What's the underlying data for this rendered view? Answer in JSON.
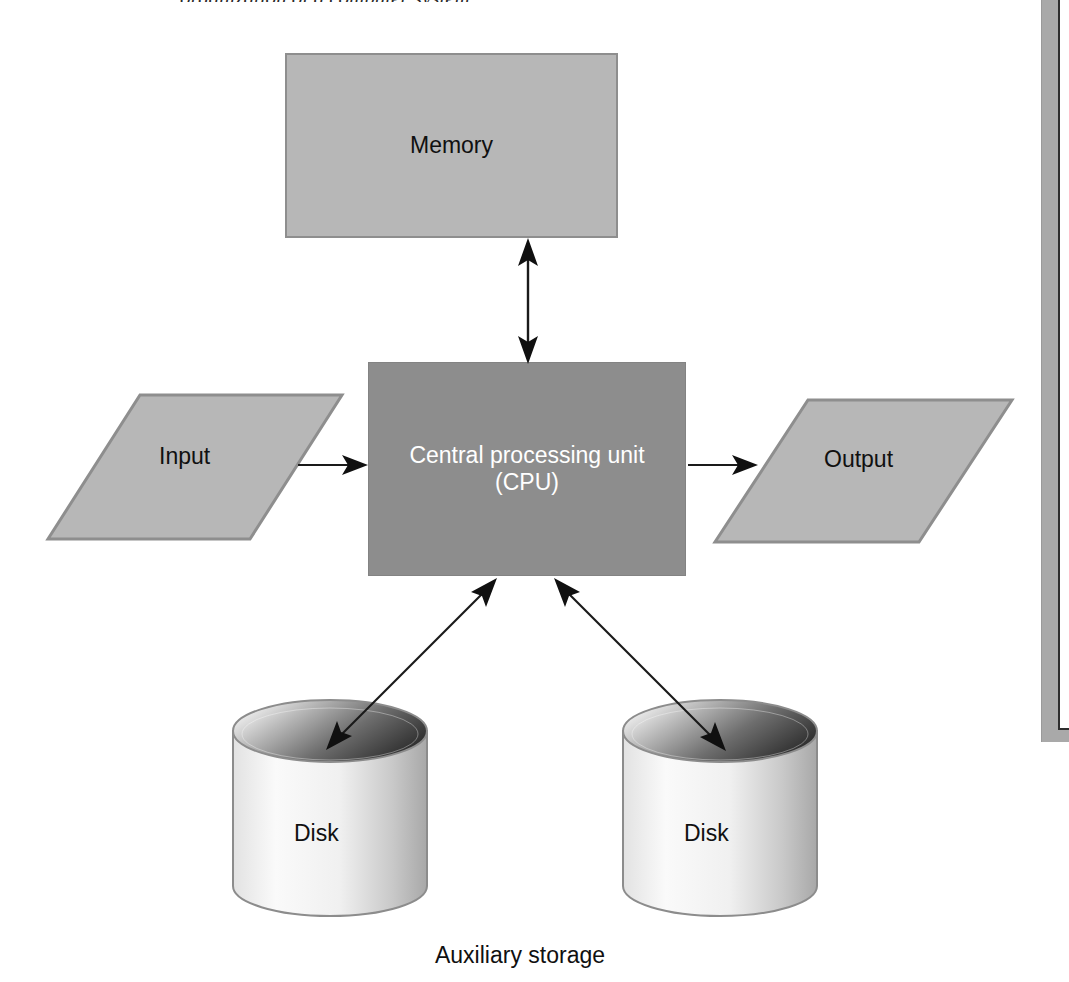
{
  "figure": {
    "title_partial": "organization of a computer system",
    "nodes": {
      "memory": {
        "label": "Memory",
        "fill": "#b7b7b7",
        "border": "#8e8e8e",
        "text_color": "#101010",
        "shape": "rectangle"
      },
      "cpu": {
        "label_line1": "Central processing unit",
        "label_line2": "(CPU)",
        "fill": "#8d8d8d",
        "border": "#838383",
        "text_color": "#ffffff",
        "shape": "rectangle"
      },
      "input": {
        "label": "Input",
        "fill": "#b7b7b7",
        "border": "#8e8e8e",
        "text_color": "#101010",
        "shape": "parallelogram"
      },
      "output": {
        "label": "Output",
        "fill": "#b7b7b7",
        "border": "#8e8e8e",
        "text_color": "#101010",
        "shape": "parallelogram"
      },
      "disk_left": {
        "label": "Disk",
        "fill_light": "#f2f2f2",
        "fill_dark": "#9d9d9d",
        "top_dark": "#3a3a3a",
        "text_color": "#101010",
        "shape": "cylinder"
      },
      "disk_right": {
        "label": "Disk",
        "fill_light": "#f2f2f2",
        "fill_dark": "#9d9d9d",
        "top_dark": "#3a3a3a",
        "text_color": "#101010",
        "shape": "cylinder"
      }
    },
    "captions": {
      "auxiliary_storage": "Auxiliary storage"
    },
    "edges": [
      {
        "name": "memory-cpu",
        "from": "memory",
        "to": "cpu",
        "arrow": "double",
        "orientation": "vertical"
      },
      {
        "name": "input-cpu",
        "from": "input",
        "to": "cpu",
        "arrow": "single",
        "orientation": "horizontal"
      },
      {
        "name": "cpu-output",
        "from": "cpu",
        "to": "output",
        "arrow": "single",
        "orientation": "horizontal"
      },
      {
        "name": "cpu-disk-left",
        "from": "cpu",
        "to": "disk_left",
        "arrow": "double",
        "orientation": "diagonal"
      },
      {
        "name": "cpu-disk-right",
        "from": "cpu",
        "to": "disk_right",
        "arrow": "double",
        "orientation": "diagonal"
      }
    ],
    "colors": {
      "page_background": "#ffffff",
      "line": "#1a1a1a",
      "frame_edge": "#a9a9a9"
    }
  }
}
